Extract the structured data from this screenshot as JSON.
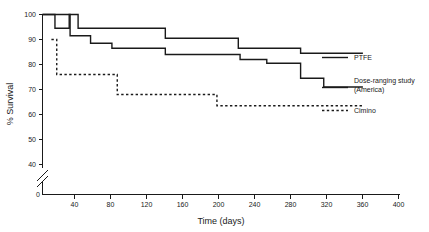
{
  "chart_data": {
    "type": "line",
    "title": "",
    "subtitle": "",
    "xlabel": "Time (days)",
    "ylabel": "% Survival",
    "xlim": [
      0,
      400
    ],
    "ylim": [
      36,
      100
    ],
    "y_axis_break": true,
    "y_break_between": [
      0,
      36
    ],
    "grid": false,
    "legend_position": "right",
    "xticks": [
      0,
      40,
      80,
      120,
      160,
      200,
      240,
      280,
      320,
      360,
      400
    ],
    "xticklabels": [
      "0",
      "40",
      "80",
      "120",
      "160",
      "200",
      "240",
      "280",
      "320",
      "360",
      "400"
    ],
    "yticks": [
      40,
      50,
      60,
      70,
      80,
      90,
      100
    ],
    "yticklabels": [
      "40",
      "50",
      "60",
      "70",
      "80",
      "90",
      "100"
    ],
    "series": [
      {
        "name": "PTFE",
        "style": "solid",
        "color": "#1a1a1a",
        "step": "post",
        "points": [
          {
            "x": 0,
            "y": 100
          },
          {
            "x": 14,
            "y": 100
          },
          {
            "x": 14,
            "y": 94.5
          },
          {
            "x": 30,
            "y": 94.5
          },
          {
            "x": 30,
            "y": 100
          },
          {
            "x": 40,
            "y": 100
          },
          {
            "x": 40,
            "y": 94.5
          },
          {
            "x": 138,
            "y": 94.5
          },
          {
            "x": 138,
            "y": 90.5
          },
          {
            "x": 220,
            "y": 90.5
          },
          {
            "x": 220,
            "y": 86.5
          },
          {
            "x": 290,
            "y": 86.5
          },
          {
            "x": 290,
            "y": 84.5
          },
          {
            "x": 360,
            "y": 84.5
          }
        ]
      },
      {
        "name": "Dose-ranging study (America)",
        "style": "solid",
        "color": "#1a1a1a",
        "step": "post",
        "points": [
          {
            "x": 0,
            "y": 100
          },
          {
            "x": 31,
            "y": 100
          },
          {
            "x": 31,
            "y": 91.5
          },
          {
            "x": 54,
            "y": 91.5
          },
          {
            "x": 54,
            "y": 88.5
          },
          {
            "x": 78,
            "y": 88.5
          },
          {
            "x": 78,
            "y": 86.5
          },
          {
            "x": 138,
            "y": 86.5
          },
          {
            "x": 138,
            "y": 84.0
          },
          {
            "x": 222,
            "y": 84.0
          },
          {
            "x": 222,
            "y": 82.0
          },
          {
            "x": 252,
            "y": 82.0
          },
          {
            "x": 252,
            "y": 80.5
          },
          {
            "x": 290,
            "y": 80.5
          },
          {
            "x": 290,
            "y": 74.5
          },
          {
            "x": 316,
            "y": 74.5
          },
          {
            "x": 316,
            "y": 71.0
          },
          {
            "x": 360,
            "y": 71.0
          }
        ]
      },
      {
        "name": "Cimino",
        "style": "dashed",
        "color": "#1a1a1a",
        "step": "post",
        "points": [
          {
            "x": 10,
            "y": 90.0
          },
          {
            "x": 16,
            "y": 90.0
          },
          {
            "x": 16,
            "y": 76.0
          },
          {
            "x": 84,
            "y": 76.0
          },
          {
            "x": 84,
            "y": 68.0
          },
          {
            "x": 196,
            "y": 68.0
          },
          {
            "x": 196,
            "y": 63.5
          },
          {
            "x": 360,
            "y": 63.5
          }
        ]
      }
    ],
    "legend": [
      {
        "label": "PTFE",
        "style": "solid"
      },
      {
        "label": "Dose-ranging study",
        "label2": "(America)",
        "style": "solid"
      },
      {
        "label": "Cimino",
        "style": "dashed"
      }
    ]
  }
}
